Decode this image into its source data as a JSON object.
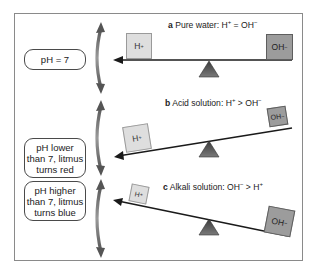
{
  "labels": {
    "neutral": "pH = 7",
    "acid": "pH lower than 7, litmus turns red",
    "acid_lines": [
      "pH lower",
      "than 7, litmus",
      "turns red"
    ],
    "alkali": "pH higher than 7, litmus turns blue",
    "alkali_lines": [
      "pH higher",
      "than 7, litmus",
      "turns blue"
    ]
  },
  "panels": [
    {
      "letter": "a",
      "title": "Pure water: H",
      "title_parts": {
        "pre": "Pure water: H",
        "sup1": "+",
        "mid": " = OH",
        "sup2": "−"
      },
      "left_ion": {
        "base": "H",
        "charge": "+"
      },
      "right_ion": {
        "base": "OH",
        "charge": "−"
      },
      "state": "balanced"
    },
    {
      "letter": "b",
      "title_parts": {
        "pre": "Acid solution: H",
        "sup1": "+",
        "mid": " > OH",
        "sup2": "−"
      },
      "left_ion": {
        "base": "H",
        "charge": "+"
      },
      "right_ion": {
        "base": "OH",
        "charge": "−"
      },
      "state": "tilted-left"
    },
    {
      "letter": "c",
      "title_parts": {
        "pre": "Alkali solution: OH",
        "sup1": "−",
        "mid": " > H",
        "sup2": "+"
      },
      "left_ion": {
        "base": "H",
        "charge": "+"
      },
      "right_ion": {
        "base": "OH",
        "charge": "−"
      },
      "state": "tilted-right"
    }
  ],
  "colors": {
    "frame": "#8a8a8a",
    "beam": "#1a1a1a",
    "fulcrum": "#555555",
    "h_box": "#dedede",
    "oh_box": "#9c9c9c",
    "curved_arrow": "#666666"
  }
}
